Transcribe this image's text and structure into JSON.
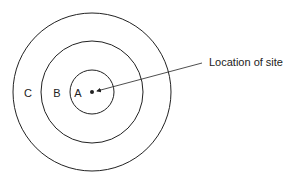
{
  "diagram": {
    "type": "concentric-zones",
    "center": {
      "x": 92,
      "y": 92
    },
    "zones": [
      {
        "label": "A",
        "radius": 22,
        "label_x": 78,
        "label_y": 97
      },
      {
        "label": "B",
        "radius": 51,
        "label_x": 57,
        "label_y": 97
      },
      {
        "label": "C",
        "radius": 79,
        "label_x": 28,
        "label_y": 97
      }
    ],
    "site_marker": {
      "x": 92,
      "y": 92,
      "r": 2
    },
    "callout": {
      "text": "Location of site",
      "text_x": 209,
      "text_y": 66,
      "line_from": {
        "x": 202,
        "y": 63
      },
      "line_to": {
        "x": 97,
        "y": 91
      }
    },
    "colors": {
      "stroke": "#222222",
      "background": "#ffffff"
    }
  }
}
